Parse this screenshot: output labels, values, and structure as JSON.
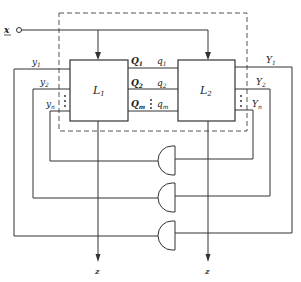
{
  "diagram": {
    "input": {
      "label": "x"
    },
    "outputs": {
      "left": "z",
      "right": "z"
    },
    "blocks": [
      {
        "id": "L1",
        "label": "L",
        "sub": "1"
      },
      {
        "id": "L2",
        "label": "L",
        "sub": "2"
      }
    ],
    "l1_inputs": [
      {
        "label": "y",
        "sub": "1"
      },
      {
        "label": "y",
        "sub": "2"
      },
      {
        "label": "y",
        "sub": "n"
      }
    ],
    "l1_outputs": [
      {
        "label": "Q",
        "sub": "1"
      },
      {
        "label": "Q",
        "sub": "2"
      },
      {
        "label": "Q",
        "sub": "m"
      }
    ],
    "l2_inputs": [
      {
        "label": "q",
        "sub": "1"
      },
      {
        "label": "q",
        "sub": "2"
      },
      {
        "label": "q",
        "sub": "m"
      }
    ],
    "l2_outputs": [
      {
        "label": "Y",
        "sub": "1"
      },
      {
        "label": "Y",
        "sub": "2"
      },
      {
        "label": "Y",
        "sub": "n"
      }
    ],
    "gates": [
      {
        "type": "AND",
        "connects": "yn-Yn"
      },
      {
        "type": "AND",
        "connects": "y2-Y2"
      },
      {
        "type": "AND",
        "connects": "y1-Y1"
      }
    ],
    "colors": {
      "line": "#333333",
      "dashed": "#555555"
    }
  }
}
